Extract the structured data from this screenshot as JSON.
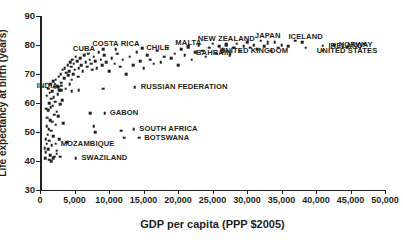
{
  "chart_data": {
    "type": "scatter",
    "title": "",
    "xlabel": "GDP per capita (PPP $2005)",
    "ylabel": "Life expectancy at birth (years)",
    "xlim": [
      0,
      50000
    ],
    "ylim": [
      30,
      90
    ],
    "grid": false,
    "legend": "none",
    "xticks": [
      0,
      5000,
      10000,
      15000,
      20000,
      25000,
      30000,
      35000,
      40000,
      45000,
      50000
    ],
    "xtick_labels": [
      "0",
      "5,000",
      "10,000",
      "15,000",
      "20,000",
      "25,000",
      "30,000",
      "35,000",
      "40,000",
      "45,000",
      "50,000"
    ],
    "yticks": [
      30,
      40,
      50,
      60,
      70,
      80,
      90
    ],
    "ytick_labels": [
      "30",
      "40",
      "50",
      "60",
      "70",
      "80",
      "90"
    ],
    "points": [
      [
        700,
        44.5
      ],
      [
        760,
        41.0
      ],
      [
        820,
        47.5
      ],
      [
        850,
        43.0
      ],
      [
        900,
        58.0
      ],
      [
        950,
        52.0
      ],
      [
        980,
        46.0
      ],
      [
        1000,
        62.5
      ],
      [
        1050,
        55.0
      ],
      [
        1100,
        49.0
      ],
      [
        1150,
        65.0
      ],
      [
        1180,
        44.0
      ],
      [
        1200,
        57.5
      ],
      [
        1250,
        51.0
      ],
      [
        1300,
        60.0
      ],
      [
        1350,
        47.0
      ],
      [
        1400,
        63.5
      ],
      [
        1450,
        54.0
      ],
      [
        1480,
        42.0
      ],
      [
        1500,
        66.5
      ],
      [
        1550,
        58.5
      ],
      [
        1600,
        50.5
      ],
      [
        1650,
        61.5
      ],
      [
        1700,
        45.5
      ],
      [
        1750,
        64.0
      ],
      [
        1800,
        53.5
      ],
      [
        1850,
        59.0
      ],
      [
        1900,
        67.5
      ],
      [
        1950,
        48.5
      ],
      [
        2000,
        62.0
      ],
      [
        2050,
        56.0
      ],
      [
        2100,
        41.5
      ],
      [
        2150,
        65.5
      ],
      [
        2200,
        60.5
      ],
      [
        2250,
        52.5
      ],
      [
        2300,
        68.0
      ],
      [
        2400,
        57.0
      ],
      [
        2450,
        43.5
      ],
      [
        2500,
        66.0
      ],
      [
        2550,
        63.0
      ],
      [
        2600,
        55.5
      ],
      [
        2700,
        69.0
      ],
      [
        2750,
        47.5
      ],
      [
        2800,
        64.5
      ],
      [
        2900,
        59.5
      ],
      [
        3000,
        70.0
      ],
      [
        3100,
        67.0
      ],
      [
        3200,
        61.0
      ],
      [
        3300,
        71.5
      ],
      [
        3400,
        53.0
      ],
      [
        3500,
        68.5
      ],
      [
        3600,
        72.0
      ],
      [
        3700,
        65.0
      ],
      [
        3800,
        70.5
      ],
      [
        3900,
        46.5
      ],
      [
        4000,
        73.0
      ],
      [
        4100,
        69.5
      ],
      [
        4200,
        71.0
      ],
      [
        4300,
        66.5
      ],
      [
        4400,
        74.0
      ],
      [
        4500,
        72.5
      ],
      [
        4600,
        68.0
      ],
      [
        4700,
        75.0
      ],
      [
        4800,
        70.0
      ],
      [
        4900,
        73.5
      ],
      [
        5000,
        71.5
      ],
      [
        5200,
        76.0
      ],
      [
        5400,
        74.5
      ],
      [
        5500,
        69.0
      ],
      [
        5600,
        72.0
      ],
      [
        5800,
        75.5
      ],
      [
        6000,
        73.0
      ],
      [
        6200,
        71.0
      ],
      [
        6400,
        76.5
      ],
      [
        6600,
        74.0
      ],
      [
        6800,
        72.5
      ],
      [
        7000,
        77.0
      ],
      [
        7200,
        75.0
      ],
      [
        7400,
        73.5
      ],
      [
        7600,
        71.5
      ],
      [
        7800,
        76.0
      ],
      [
        8000,
        74.5
      ],
      [
        8200,
        72.0
      ],
      [
        8500,
        77.5
      ],
      [
        8800,
        75.0
      ],
      [
        9000,
        73.0
      ],
      [
        9300,
        76.5
      ],
      [
        9600,
        74.0
      ],
      [
        10000,
        71.0
      ],
      [
        10400,
        75.5
      ],
      [
        10800,
        73.5
      ],
      [
        11200,
        77.0
      ],
      [
        11600,
        72.5
      ],
      [
        12000,
        75.0
      ],
      [
        12500,
        70.0
      ],
      [
        13000,
        76.0
      ],
      [
        13500,
        73.0
      ],
      [
        14000,
        77.5
      ],
      [
        14500,
        74.5
      ],
      [
        15000,
        72.0
      ],
      [
        15500,
        76.5
      ],
      [
        16000,
        75.0
      ],
      [
        16500,
        73.5
      ],
      [
        17000,
        78.0
      ],
      [
        17500,
        74.0
      ],
      [
        18000,
        76.0
      ],
      [
        18500,
        79.0
      ],
      [
        19000,
        75.5
      ],
      [
        19500,
        77.0
      ],
      [
        20000,
        73.0
      ],
      [
        20500,
        78.5
      ],
      [
        21000,
        76.5
      ],
      [
        21500,
        79.5
      ],
      [
        22000,
        75.0
      ],
      [
        22500,
        77.5
      ],
      [
        23000,
        80.0
      ],
      [
        23500,
        78.0
      ],
      [
        24000,
        76.0
      ],
      [
        24500,
        79.0
      ],
      [
        25000,
        80.5
      ],
      [
        25500,
        77.0
      ],
      [
        26000,
        79.5
      ],
      [
        26500,
        78.5
      ],
      [
        27000,
        80.0
      ],
      [
        27500,
        76.5
      ],
      [
        28000,
        79.0
      ],
      [
        28500,
        80.5
      ],
      [
        29000,
        78.0
      ],
      [
        29500,
        79.5
      ],
      [
        30000,
        81.0
      ],
      [
        30500,
        79.0
      ],
      [
        31000,
        80.0
      ],
      [
        31500,
        78.5
      ],
      [
        32000,
        81.5
      ],
      [
        32500,
        79.5
      ],
      [
        33000,
        80.5
      ],
      [
        33500,
        78.0
      ],
      [
        34000,
        81.0
      ],
      [
        34500,
        79.0
      ],
      [
        35000,
        80.0
      ],
      [
        36000,
        79.5
      ],
      [
        37000,
        81.5
      ],
      [
        38500,
        79.0
      ],
      [
        41000,
        78.0
      ],
      [
        47000,
        80.5
      ],
      [
        7300,
        56.5
      ],
      [
        7800,
        52.0
      ],
      [
        8000,
        50.0
      ],
      [
        11800,
        50.5
      ],
      [
        12200,
        48.0
      ],
      [
        5600,
        64.5
      ],
      [
        4600,
        64.0
      ],
      [
        3100,
        64.5
      ],
      [
        2600,
        65.5
      ],
      [
        9200,
        65.0
      ],
      [
        2900,
        41.5
      ],
      [
        1900,
        41.0
      ],
      [
        2400,
        42.5
      ],
      [
        1300,
        40.5
      ],
      [
        1650,
        40.0
      ]
    ],
    "annotations": [
      {
        "label": "CUBA",
        "x": 8000,
        "y": 78.5,
        "align": "left",
        "dot_x": 9200,
        "dot_y": 78.5
      },
      {
        "label": "COSTA RICA",
        "x": 11000,
        "y": 80.5,
        "align": "center",
        "dot_x": 11000,
        "dot_y": 78.5
      },
      {
        "label": "CHILE",
        "x": 15400,
        "y": 78.8,
        "align": "right",
        "dot_x": 14800,
        "dot_y": 78.8
      },
      {
        "label": "MALTA",
        "x": 21500,
        "y": 80.8,
        "align": "center",
        "dot_x": 21500,
        "dot_y": 79.2
      },
      {
        "label": "NEW ZEALAND",
        "x": 27000,
        "y": 82.0,
        "align": "center",
        "dot_x": 27000,
        "dot_y": 80.2
      },
      {
        "label": "JAPAN",
        "x": 33000,
        "y": 83.0,
        "align": "center",
        "dot_x": 33000,
        "dot_y": 81.2
      },
      {
        "label": "ICELAND",
        "x": 38500,
        "y": 82.8,
        "align": "center",
        "dot_x": 38000,
        "dot_y": 81.0
      },
      {
        "label": "IRELAND",
        "x": 41800,
        "y": 79.8,
        "align": "right",
        "dot_x": 41000,
        "dot_y": 79.8
      },
      {
        "label": "NORWAY",
        "x": 43300,
        "y": 80.0,
        "align": "right",
        "dot_x": 42600,
        "dot_y": 80.0
      },
      {
        "label": "UNITED STATES",
        "x": 44500,
        "y": 77.8,
        "align": "center",
        "dot_x": 44500,
        "dot_y": 79.3
      },
      {
        "label": "UNITED KINGDOM",
        "x": 31000,
        "y": 77.8,
        "align": "center",
        "dot_x": 28200,
        "dot_y": 79.0
      },
      {
        "label": "BAHRAIN",
        "x": 25200,
        "y": 77.2,
        "align": "center",
        "dot_x": 26500,
        "dot_y": 78.3
      },
      {
        "label": "RUSSIAN FEDERATION",
        "x": 14600,
        "y": 65.5,
        "align": "right",
        "dot_x": 13700,
        "dot_y": 65.5
      },
      {
        "label": "GABON",
        "x": 10100,
        "y": 56.5,
        "align": "right",
        "dot_x": 9400,
        "dot_y": 56.5
      },
      {
        "label": "SOUTH AFRICA",
        "x": 14400,
        "y": 51.0,
        "align": "right",
        "dot_x": 13600,
        "dot_y": 51.0
      },
      {
        "label": "BOTSWANA",
        "x": 15100,
        "y": 48.0,
        "align": "right",
        "dot_x": 14400,
        "dot_y": 48.0
      },
      {
        "label": "MOZAMBIQUE",
        "x": 3000,
        "y": 46.0,
        "align": "right",
        "dot_x": 2300,
        "dot_y": 46.0
      },
      {
        "label": "SWAZILAND",
        "x": 6000,
        "y": 41.0,
        "align": "right",
        "dot_x": 5200,
        "dot_y": 41.0
      },
      {
        "label": "INDIA",
        "x": 2600,
        "y": 66.0,
        "align": "left",
        "dot_x": 3100,
        "dot_y": 66.0
      }
    ]
  },
  "colors": {
    "ink": "#231f20",
    "background": "#ffffff",
    "marker": "#231f20"
  }
}
